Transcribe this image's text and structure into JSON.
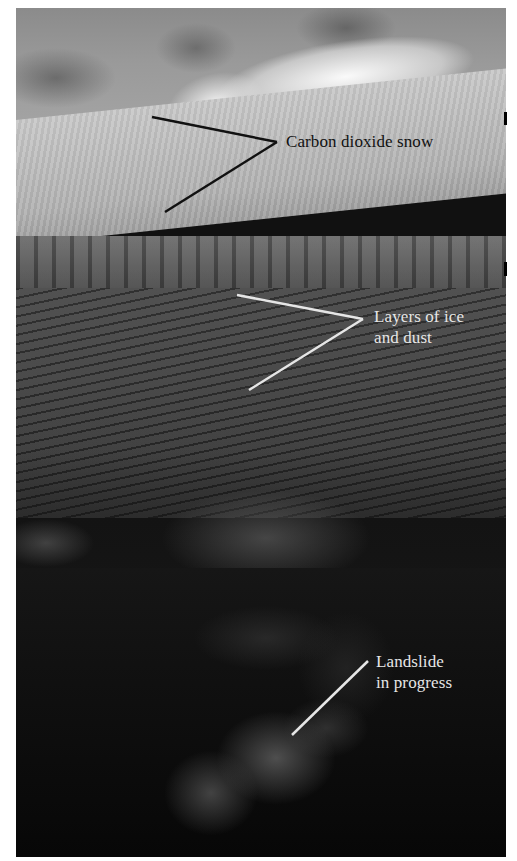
{
  "image": {
    "description": "Mars polar cap cliff photograph with annotations",
    "colors": {
      "background": "#ffffff",
      "dark_label": "#111111",
      "light_label": "#e6e6e6",
      "dark_leader": "#111111",
      "light_leader": "#e6e6e6"
    }
  },
  "annotations": [
    {
      "id": "carbon-dioxide-snow",
      "lines": [
        "Carbon dioxide snow"
      ],
      "text_color": "dark"
    },
    {
      "id": "layers-of-ice-and-dust",
      "lines": [
        "Layers of ice",
        "and dust"
      ],
      "text_color": "light"
    },
    {
      "id": "landslide-in-progress",
      "lines": [
        "Landslide",
        "in progress"
      ],
      "text_color": "light"
    }
  ]
}
